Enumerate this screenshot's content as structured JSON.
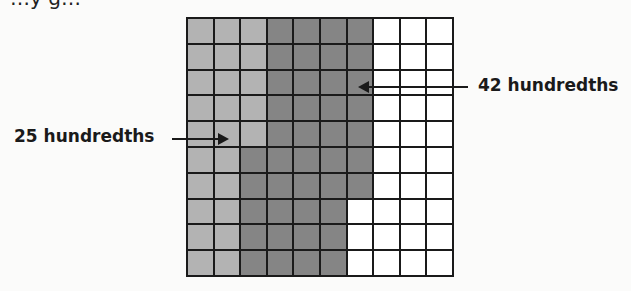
{
  "caption_partial": "…y g…",
  "grid": {
    "rows": 10,
    "cols": 10,
    "colors": {
      "light": "#b3b3b3",
      "dark": "#858585",
      "empty": "#ffffff",
      "line": "#1a1a1a"
    },
    "light_cells": "cols 0-1 all rows; col 2 rows 0-4",
    "dark_cells": "col 2 rows 5-9; cols 3-5 all rows; col 6 rows 0-6"
  },
  "labels": {
    "left": "25 hundredths",
    "right": "42 hundredths"
  }
}
